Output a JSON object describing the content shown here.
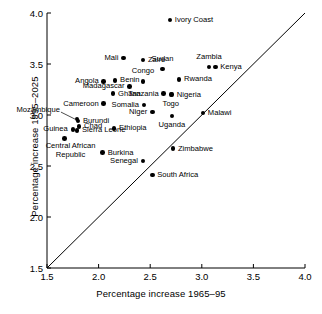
{
  "chart_data": {
    "type": "scatter",
    "title": "",
    "xlabel": "Percentage increase 1965–95",
    "ylabel": "Percentage increase 1995–2025",
    "xlim": [
      1.5,
      4.0
    ],
    "ylim": [
      1.5,
      4.0
    ],
    "xticks": [
      "1.5",
      "2.0",
      "2.5",
      "3.0",
      "3.5",
      "4.0"
    ],
    "yticks": [
      "1.5",
      "2.0",
      "2.5",
      "3.0",
      "3.5",
      "4.0"
    ],
    "grid": false,
    "legend": "none",
    "reference_line": {
      "type": "identity",
      "from": [
        1.5,
        1.5
      ],
      "to": [
        4.0,
        4.0
      ]
    },
    "points": [
      {
        "label": "Ivory Coast",
        "x": 2.69,
        "y": 3.93,
        "pos": "right"
      },
      {
        "label": "Mali",
        "x": 2.24,
        "y": 3.56,
        "pos": "left"
      },
      {
        "label": "Zaire",
        "x": 2.43,
        "y": 3.54,
        "pos": "right"
      },
      {
        "label": "Zambia",
        "x": 3.07,
        "y": 3.47,
        "pos": "above"
      },
      {
        "label": "Kenya",
        "x": 3.13,
        "y": 3.47,
        "pos": "right"
      },
      {
        "label": "Sudan",
        "x": 2.62,
        "y": 3.45,
        "pos": "above"
      },
      {
        "label": "Congo",
        "x": 2.43,
        "y": 3.33,
        "pos": "above"
      },
      {
        "label": "Angola",
        "x": 2.05,
        "y": 3.33,
        "pos": "left"
      },
      {
        "label": "Benin",
        "x": 2.16,
        "y": 3.34,
        "pos": "right"
      },
      {
        "label": "Rwanda",
        "x": 2.78,
        "y": 3.35,
        "pos": "right"
      },
      {
        "label": "Madagascar",
        "x": 2.3,
        "y": 3.28,
        "pos": "left"
      },
      {
        "label": "Ghana",
        "x": 2.14,
        "y": 3.21,
        "pos": "right"
      },
      {
        "label": "Tanzania",
        "x": 2.63,
        "y": 3.21,
        "pos": "left"
      },
      {
        "label": "Nigeria",
        "x": 2.71,
        "y": 3.2,
        "pos": "right"
      },
      {
        "label": "Cameroon",
        "x": 2.05,
        "y": 3.11,
        "pos": "left"
      },
      {
        "label": "Somalia",
        "x": 2.44,
        "y": 3.1,
        "pos": "left"
      },
      {
        "label": "Togo",
        "x": 2.7,
        "y": 3.2,
        "pos": "below"
      },
      {
        "label": "Niger",
        "x": 2.52,
        "y": 3.03,
        "pos": "left"
      },
      {
        "label": "Malawi",
        "x": 3.01,
        "y": 3.02,
        "pos": "right"
      },
      {
        "label": "Uganda",
        "x": 2.71,
        "y": 2.99,
        "pos": "below"
      },
      {
        "label": "Ethiopia",
        "x": 2.15,
        "y": 2.87,
        "pos": "right"
      },
      {
        "label": "Mozambique",
        "x": 1.79,
        "y": 2.96,
        "pos": "leader"
      },
      {
        "label": "Burundi",
        "x": 1.8,
        "y": 2.94,
        "pos": "right"
      },
      {
        "label": "Chad",
        "x": 1.81,
        "y": 2.89,
        "pos": "right"
      },
      {
        "label": "Sierra Leone",
        "x": 1.79,
        "y": 2.85,
        "pos": "right"
      },
      {
        "label": "Guinea",
        "x": 1.75,
        "y": 2.86,
        "pos": "left"
      },
      {
        "label": "Central African Republic",
        "x": 1.67,
        "y": 2.77,
        "pos": "below2"
      },
      {
        "label": "Burkina",
        "x": 2.04,
        "y": 2.63,
        "pos": "right"
      },
      {
        "label": "Senegal",
        "x": 2.43,
        "y": 2.55,
        "pos": "left"
      },
      {
        "label": "Zimbabwe",
        "x": 2.72,
        "y": 2.67,
        "pos": "right"
      },
      {
        "label": "South Africa",
        "x": 2.52,
        "y": 2.41,
        "pos": "right"
      }
    ]
  }
}
